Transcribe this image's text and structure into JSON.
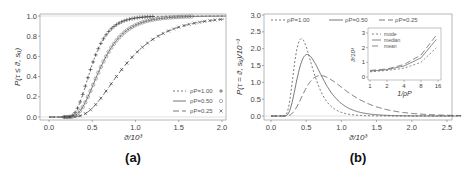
{
  "chart_data": [
    {
      "panel": "(a)",
      "type": "line",
      "title": "",
      "xlabel": "ϑ/10³",
      "ylabel": "P(τ ≤ ϑ, s_u)",
      "xlim": [
        -0.05,
        2.05
      ],
      "ylim": [
        -0.03,
        1.03
      ],
      "xticks": [
        "0.0",
        "0.5",
        "1.0",
        "1.5",
        "2.0"
      ],
      "yticks": [
        "0.0",
        "0.2",
        "0.4",
        "0.6",
        "0.8",
        "1.0"
      ],
      "legend_position": "lower right",
      "series": [
        {
          "name": "ρ_P=1.00",
          "line": "dotted",
          "marker": "+",
          "mu": -0.99,
          "sigma": 0.42
        },
        {
          "name": "ρ_P=0.50",
          "line": "solid",
          "marker": "○",
          "mu": -0.73,
          "sigma": 0.45
        },
        {
          "name": "ρ_P=0.25",
          "line": "dashed",
          "marker": "×",
          "mu": -0.29,
          "sigma": 0.5
        }
      ],
      "sample_points": {
        "x": [
          0.2,
          0.3,
          0.4,
          0.5,
          0.75,
          1.0,
          1.5,
          2.0
        ],
        "rho_1.00": [
          0.03,
          0.3,
          0.57,
          0.75,
          0.93,
          0.98,
          1.0,
          1.0
        ],
        "rho_0.50": [
          0.01,
          0.15,
          0.38,
          0.55,
          0.82,
          0.94,
          0.99,
          1.0
        ],
        "rho_0.25": [
          0.0,
          0.03,
          0.1,
          0.22,
          0.5,
          0.71,
          0.92,
          0.98
        ]
      }
    },
    {
      "panel": "(b)",
      "type": "line",
      "title": "",
      "xlabel": "ϑ/10³",
      "ylabel": "P(τ = ϑ, s_u)/10⁻³",
      "xlim": [
        -0.05,
        2.7
      ],
      "ylim": [
        -0.05,
        3.05
      ],
      "xticks": [
        "0.0",
        "0.5",
        "1.0",
        "1.5",
        "2.0",
        "2.5"
      ],
      "yticks": [
        "0.0",
        "0.5",
        "1.0",
        "1.5",
        "2.0",
        "2.5",
        "3.0"
      ],
      "legend_position": "top",
      "series": [
        {
          "name": "ρ_P=1.00",
          "line": "dotted",
          "peak_x": 0.32,
          "peak_y": 2.3
        },
        {
          "name": "ρ_P=0.50",
          "line": "solid",
          "peak_x": 0.45,
          "peak_y": 1.83
        },
        {
          "name": "ρ_P=0.25",
          "line": "dashed",
          "peak_x": 0.68,
          "peak_y": 1.2
        }
      ],
      "inset": {
        "type": "line",
        "xlabel": "1/ρ_P",
        "ylabel": "ϑ/10³",
        "xticks": [
          "1",
          "2",
          "4",
          "8",
          "16"
        ],
        "yticks": [
          "0",
          "1",
          "2",
          "3"
        ],
        "x": [
          1,
          2,
          4,
          8,
          16
        ],
        "series": [
          {
            "name": "mode",
            "line": "dotted",
            "values": [
              0.35,
              0.45,
              0.6,
              1.0,
              2.1
            ]
          },
          {
            "name": "median",
            "line": "solid",
            "values": [
              0.4,
              0.5,
              0.75,
              1.3,
              2.7
            ]
          },
          {
            "name": "mean",
            "line": "dashed",
            "values": [
              0.45,
              0.55,
              0.85,
              1.5,
              3.0
            ]
          }
        ]
      }
    }
  ],
  "labels": {
    "panel_a": "(a)",
    "panel_b": "(b)",
    "a_xlabel": "ϑ/10³",
    "a_ylabel": "P(τ ≤ ϑ, s",
    "b_xlabel": "ϑ/10³",
    "b_ylabel": "P(τ = ϑ, s",
    "legend": [
      "ρ",
      "=1.00",
      "=0.50",
      "=0.25"
    ],
    "inset_legend": [
      "mode",
      "median",
      "mean"
    ],
    "inset_xlabel": "1/ρ",
    "inset_ylabel": "ϑ/10³"
  }
}
